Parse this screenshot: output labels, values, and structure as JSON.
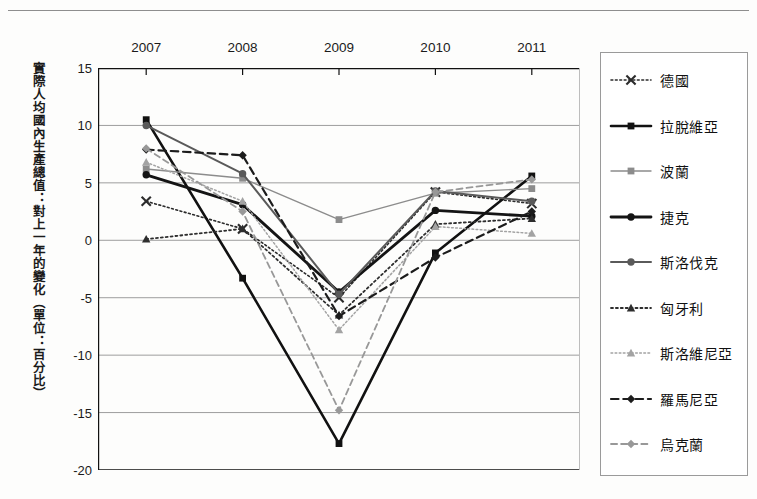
{
  "chart_data": {
    "type": "line",
    "title": "",
    "xlabel": "",
    "ylabel": "實際人均國內生產總值：對上一年的變化（單位：百分比）",
    "categories": [
      "2007",
      "2008",
      "2009",
      "2010",
      "2011"
    ],
    "x": [
      2007,
      2008,
      2009,
      2010,
      2011
    ],
    "ylim": [
      -20,
      15
    ],
    "yticks": [
      15,
      10,
      5,
      0,
      -5,
      -10,
      -15,
      -20
    ],
    "ytick_labels": [
      "15",
      "10",
      "5",
      "0",
      "-5",
      "-10",
      "-15",
      "-20"
    ],
    "grid": true,
    "legend_position": "right",
    "series": [
      {
        "name": "德國",
        "values": [
          3.4,
          1.0,
          -5.0,
          4.2,
          3.2
        ],
        "color": "#2b2b2b",
        "line_style": "dotted",
        "marker": "x",
        "line_width": 1.6
      },
      {
        "name": "拉脫維亞",
        "values": [
          10.5,
          -3.3,
          -17.7,
          -1.1,
          5.6
        ],
        "color": "#111111",
        "line_style": "solid",
        "marker": "square",
        "line_width": 2.6
      },
      {
        "name": "波蘭",
        "values": [
          6.2,
          5.4,
          1.8,
          4.1,
          4.5
        ],
        "color": "#8c8c8c",
        "line_style": "solid",
        "marker": "square",
        "line_width": 1.4
      },
      {
        "name": "捷克",
        "values": [
          5.7,
          3.1,
          -4.5,
          2.6,
          2.1
        ],
        "color": "#141414",
        "line_style": "solid",
        "marker": "circle",
        "line_width": 2.8
      },
      {
        "name": "斯洛伐克",
        "values": [
          10.0,
          5.8,
          -4.7,
          4.3,
          3.4
        ],
        "color": "#5a5a5a",
        "line_style": "solid",
        "marker": "circle",
        "line_width": 2.0
      },
      {
        "name": "匈牙利",
        "values": [
          0.1,
          1.0,
          -6.5,
          1.4,
          1.9
        ],
        "color": "#2e2e2e",
        "line_style": "dotted",
        "marker": "triangle",
        "line_width": 1.8
      },
      {
        "name": "斯洛維尼亞",
        "values": [
          6.8,
          3.4,
          -7.8,
          1.2,
          0.6
        ],
        "color": "#a3a3a3",
        "line_style": "dotted",
        "marker": "triangle",
        "line_width": 1.5
      },
      {
        "name": "羅馬尼亞",
        "values": [
          7.9,
          7.4,
          -6.6,
          -1.5,
          2.5
        ],
        "color": "#1c1c1c",
        "line_style": "dashed",
        "marker": "diamond",
        "line_width": 2.2
      },
      {
        "name": "烏克蘭",
        "values": [
          8.0,
          2.5,
          -14.8,
          4.2,
          5.3
        ],
        "color": "#989898",
        "line_style": "dashed",
        "marker": "diamond",
        "line_width": 1.8
      }
    ]
  },
  "legend": {
    "items": [
      {
        "label": "德國"
      },
      {
        "label": "拉脫維亞"
      },
      {
        "label": "波蘭"
      },
      {
        "label": "捷克"
      },
      {
        "label": "斯洛伐克"
      },
      {
        "label": "匈牙利"
      },
      {
        "label": "斯洛維尼亞"
      },
      {
        "label": "羅馬尼亞"
      },
      {
        "label": "烏克蘭"
      }
    ]
  },
  "axis": {
    "y_title": "實際人均國內生產總值：對上一年的變化（單位：百分比）"
  },
  "colors": {
    "grid": "#9d9d9d",
    "axis": "#111111",
    "background": "#fdfdfc",
    "legend_border": "#9a9a9a"
  }
}
